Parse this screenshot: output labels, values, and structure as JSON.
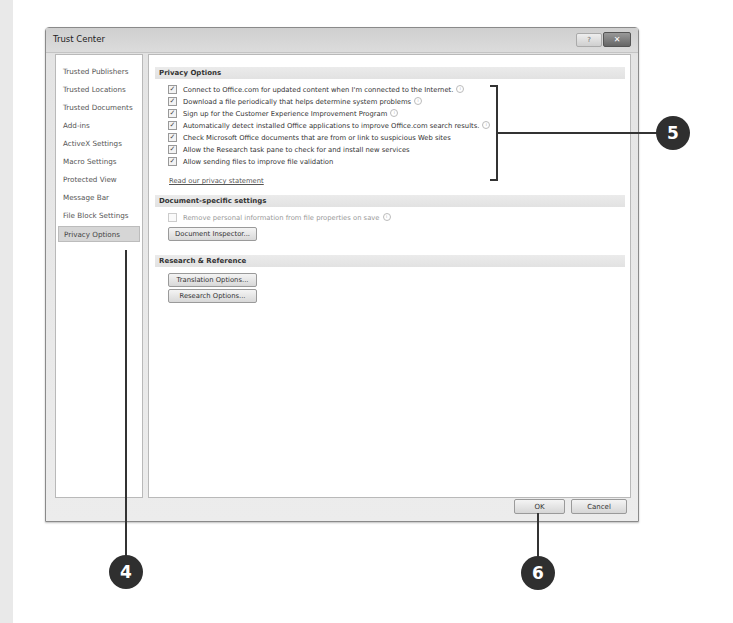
{
  "window": {
    "title": "Trust Center",
    "help_label": "?",
    "close_label": "✕"
  },
  "sidebar": {
    "items": [
      {
        "label": "Trusted Publishers",
        "selected": false
      },
      {
        "label": "Trusted Locations",
        "selected": false
      },
      {
        "label": "Trusted Documents",
        "selected": false
      },
      {
        "label": "Add-ins",
        "selected": false
      },
      {
        "label": "ActiveX Settings",
        "selected": false
      },
      {
        "label": "Macro Settings",
        "selected": false
      },
      {
        "label": "Protected View",
        "selected": false
      },
      {
        "label": "Message Bar",
        "selected": false
      },
      {
        "label": "File Block Settings",
        "selected": false
      },
      {
        "label": "Privacy Options",
        "selected": true
      }
    ]
  },
  "privacy_options": {
    "header": "Privacy Options",
    "checks": [
      {
        "label": "Connect to Office.com for updated content when I'm connected to the Internet.",
        "checked": true,
        "info": true
      },
      {
        "label": "Download a file periodically that helps determine system problems",
        "checked": true,
        "info": true
      },
      {
        "label": "Sign up for the Customer Experience Improvement Program",
        "checked": true,
        "info": true
      },
      {
        "label": "Automatically detect installed Office applications to improve Office.com search results.",
        "checked": true,
        "info": true
      },
      {
        "label": "Check Microsoft Office documents that are from or link to suspicious Web sites",
        "checked": true,
        "info": false
      },
      {
        "label": "Allow the Research task pane to check for and install new services",
        "checked": true,
        "info": false
      },
      {
        "label": "Allow sending files to improve file validation",
        "checked": true,
        "info": false
      }
    ],
    "privacy_link": "Read our privacy statement"
  },
  "document_specific": {
    "header": "Document-specific settings",
    "remove_info_label": "Remove personal information from file properties on save",
    "remove_info_checked": false,
    "inspector_button": "Document Inspector..."
  },
  "research_reference": {
    "header": "Research & Reference",
    "translation_button": "Translation Options...",
    "research_button": "Research Options..."
  },
  "footer": {
    "ok_label": "OK",
    "cancel_label": "Cancel"
  },
  "callouts": {
    "sidebar_step": "4",
    "options_step": "5",
    "ok_step": "6"
  },
  "icons": {
    "check_glyph": "✓",
    "info_glyph": "i"
  }
}
